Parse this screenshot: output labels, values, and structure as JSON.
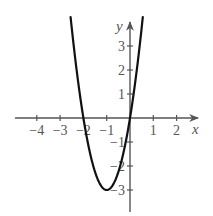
{
  "chart_data": {
    "type": "line",
    "title": "",
    "xlabel": "x",
    "ylabel": "y",
    "function": "y = 3x^2 + 6x",
    "vertex": [
      -1,
      -3
    ],
    "x_intercepts": [
      -2,
      0
    ],
    "y_intercept": 0,
    "xlim": [
      -4.6,
      2.9
    ],
    "ylim": [
      -4,
      4.1
    ],
    "x_ticks": [
      -4,
      -3,
      -2,
      -1,
      1,
      2
    ],
    "x_tick_labels": [
      "−4",
      "−3",
      "−2",
      "−1",
      "1",
      "2"
    ],
    "y_ticks": [
      -3,
      -2,
      -1,
      1,
      2,
      3
    ],
    "y_tick_labels": [
      "−3",
      "−2",
      "−1",
      "1",
      "2",
      "3"
    ],
    "grid": false,
    "legend": null,
    "series": [
      {
        "name": "parabola",
        "x": [
          -2.55,
          -2.5,
          -2.25,
          -2,
          -1.75,
          -1.5,
          -1.25,
          -1,
          -0.75,
          -0.5,
          -0.25,
          0,
          0.25,
          0.5,
          0.55
        ],
        "values": [
          4.2075,
          3.75,
          1.6875,
          0,
          -1.3125,
          -2.25,
          -2.8125,
          -3,
          -2.8125,
          -2.25,
          -1.3125,
          0,
          1.6875,
          3.75,
          4.2075
        ]
      }
    ]
  },
  "colors": {
    "curve": "#111111",
    "axis": "#555555",
    "background": "#ffffff"
  }
}
